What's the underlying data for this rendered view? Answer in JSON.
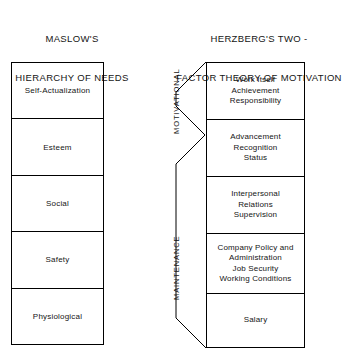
{
  "diagram": {
    "left_panel": {
      "title_lines": [
        "MASLOW'S",
        "HIERARCHY OF NEEDS"
      ],
      "needs": [
        {
          "label": "Self-Actualization"
        },
        {
          "label": "Esteem"
        },
        {
          "label": "Social"
        },
        {
          "label": "Safety"
        },
        {
          "label": "Physiological"
        }
      ]
    },
    "right_panel": {
      "title_lines": [
        "HERZBERG'S TWO -",
        "FACTOR THEORY OF MOTIVATION"
      ],
      "group_labels": {
        "motivational": "MOTIVATIONAL",
        "maintenance": "MAINTENANCE"
      },
      "factors": [
        {
          "text": "Work  Itself\nAchievement\nResponsibility"
        },
        {
          "text": "Advancement\nRecognition\nStatus"
        },
        {
          "text": "Interpersonal\nRelations\nSupervision"
        },
        {
          "text": "Company Policy and\nAdministration\nJob  Security\nWorking  Conditions"
        },
        {
          "text": "Salary"
        }
      ]
    },
    "colors": {
      "ink": "#000000",
      "text": "#151515",
      "background": "#ffffff"
    }
  }
}
